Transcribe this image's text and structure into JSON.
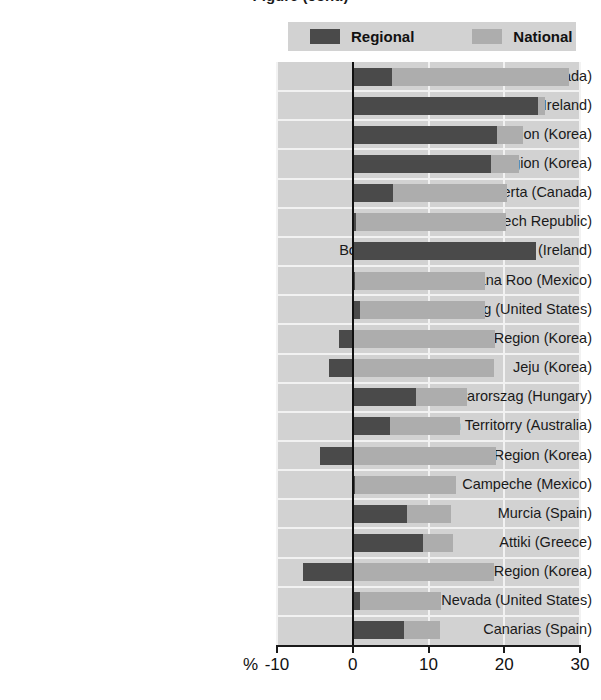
{
  "title": "Figure (cont.)",
  "legend": {
    "position": "top",
    "items": [
      {
        "label": "Regional",
        "color": "#4a4a4a",
        "name": "regional"
      },
      {
        "label": "National",
        "color": "#adadad",
        "name": "national"
      }
    ]
  },
  "axis": {
    "unit_label": "%",
    "ticks": [
      -10,
      0,
      10,
      20,
      30
    ],
    "tick_labels": [
      "-10",
      "0",
      "10",
      "20",
      "30"
    ]
  },
  "colors": {
    "regional": "#4a4a4a",
    "national": "#adadad",
    "plot_background": "#d2d2d2",
    "gridline": "#f2f2f2",
    "zero_line": "#111111",
    "text": "#1a1a1a"
  },
  "chart_data": {
    "type": "bar",
    "orientation": "horizontal",
    "overlay": true,
    "title": "Figure (cont.)",
    "xlabel": "%",
    "ylabel": "",
    "xlim": [
      -10,
      30
    ],
    "xticks": [
      -10,
      0,
      10,
      20,
      30
    ],
    "grid": true,
    "legend_position": "top",
    "categories": [
      "Northwest Territories (Canada)",
      "Southern and Eastern (Ireland)",
      "Capital Region (Korea)",
      "Chungcheong Region (Korea)",
      "Alberta (Canada)",
      "Stredni Cechy (Czech Republic)",
      "Border, Midlands and Western (Ireland)",
      "Quintana Roo (Mexico)",
      "Wyoming (United States)",
      "Gyeonbuk Region (Korea)",
      "Jeju (Korea)",
      "Kosep-Magyarorszag (Hungary)",
      "Northern Territorry (Australia)",
      "Gyeongnam Region (Korea)",
      "Campeche (Mexico)",
      "Murcia (Spain)",
      "Attiki (Greece)",
      "Gangwon Region (Korea)",
      "Nevada (United States)",
      "Canarias  (Spain)"
    ],
    "series": [
      {
        "name": "Regional",
        "color": "#4a4a4a",
        "values": [
          5.2,
          24.4,
          19.0,
          18.2,
          5.3,
          0.4,
          24.2,
          0.3,
          0.9,
          -1.8,
          -3.2,
          8.3,
          4.9,
          -4.3,
          0.3,
          7.1,
          9.3,
          -6.6,
          0.9,
          6.8
        ]
      },
      {
        "name": "National",
        "color": "#adadad",
        "values": [
          28.6,
          25.4,
          22.5,
          22.0,
          20.4,
          20.2,
          0.0,
          17.5,
          17.4,
          18.8,
          18.7,
          15.1,
          14.1,
          18.9,
          13.6,
          13.0,
          13.3,
          18.7,
          11.7,
          11.5
        ]
      }
    ]
  }
}
